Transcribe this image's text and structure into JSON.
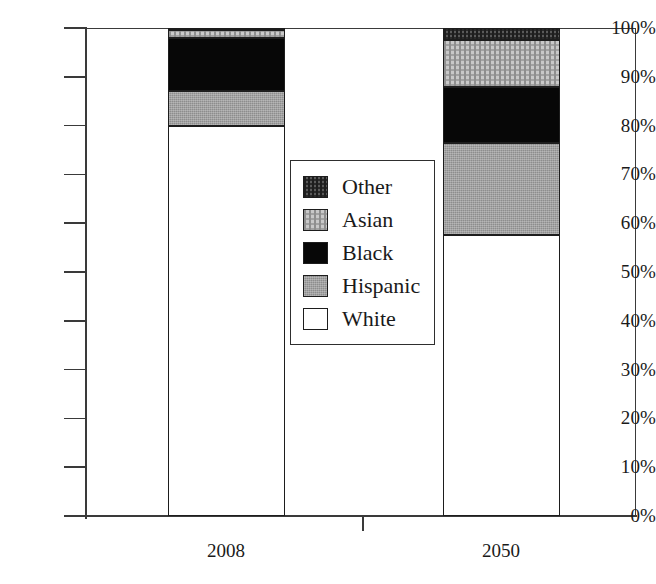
{
  "chart_data": {
    "type": "bar",
    "subtype": "stacked-100-percent",
    "title": "",
    "subtitle": "",
    "xlabel": "",
    "ylabel": "",
    "categories": [
      "2008",
      "2050"
    ],
    "ylim": [
      0,
      100
    ],
    "ytick_values": [
      0,
      10,
      20,
      30,
      40,
      50,
      60,
      70,
      80,
      90,
      100
    ],
    "ytick_labels": [
      "0%",
      "10%",
      "20%",
      "30%",
      "40%",
      "50%",
      "60%",
      "70%",
      "80%",
      "90%",
      "100%"
    ],
    "grid": false,
    "legend_position": "center",
    "legend_entries": [
      "Other",
      "Asian",
      "Black",
      "Hispanic",
      "White"
    ],
    "series": [
      {
        "name": "White",
        "values": [
          80.0,
          57.5
        ],
        "fill": "white",
        "color": "#ffffff"
      },
      {
        "name": "Hispanic",
        "values": [
          7.0,
          19.0
        ],
        "fill": "hispanic",
        "color": "#8d8d8d"
      },
      {
        "name": "Black",
        "values": [
          11.0,
          11.5
        ],
        "fill": "black",
        "color": "#070707"
      },
      {
        "name": "Asian",
        "values": [
          1.5,
          9.5
        ],
        "fill": "asian",
        "color": "#c9c9c9"
      },
      {
        "name": "Other",
        "values": [
          0.5,
          2.5
        ],
        "fill": "other",
        "color": "#5a5a5a"
      }
    ]
  },
  "axis": {
    "y_ticks": [
      {
        "label": "100%",
        "value": 100
      },
      {
        "label": "90%",
        "value": 90
      },
      {
        "label": "80%",
        "value": 80
      },
      {
        "label": "70%",
        "value": 70
      },
      {
        "label": "60%",
        "value": 60
      },
      {
        "label": "50%",
        "value": 50
      },
      {
        "label": "40%",
        "value": 40
      },
      {
        "label": "30%",
        "value": 30
      },
      {
        "label": "20%",
        "value": 20
      },
      {
        "label": "10%",
        "value": 10
      },
      {
        "label": "0%",
        "value": 0
      }
    ],
    "x_ticks": [
      {
        "label": "2008"
      },
      {
        "label": "2050"
      }
    ]
  },
  "legend": {
    "items": [
      {
        "label": "Other",
        "fill": "other"
      },
      {
        "label": "Asian",
        "fill": "asian"
      },
      {
        "label": "Black",
        "fill": "black"
      },
      {
        "label": "Hispanic",
        "fill": "hispanic"
      },
      {
        "label": "White",
        "fill": "white"
      }
    ]
  }
}
